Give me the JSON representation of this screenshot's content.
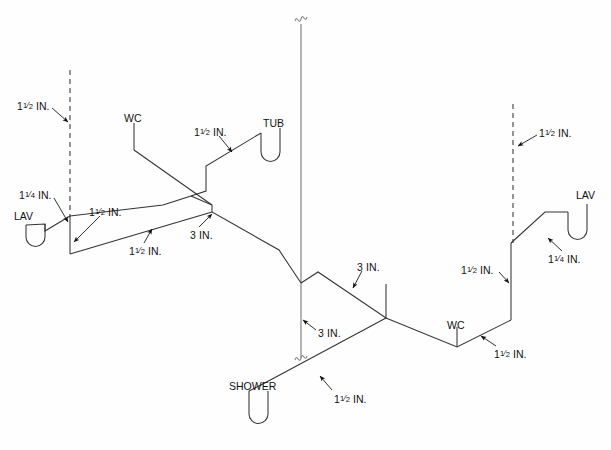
{
  "diagram": {
    "kind": "isometric-drainage-vent-riser",
    "background_color": "#ffffff",
    "pipe_color": "#333333",
    "stack_color": "#8c8c8c",
    "fixtures": [
      {
        "id": "lav-left",
        "label": "LAV",
        "x": 14,
        "y": 211
      },
      {
        "id": "wc-left",
        "label": "WC",
        "x": 124,
        "y": 113
      },
      {
        "id": "tub",
        "label": "TUB",
        "x": 263,
        "y": 118
      },
      {
        "id": "lav-right",
        "label": "LAV",
        "x": 576,
        "y": 190
      },
      {
        "id": "wc-right",
        "label": "WC",
        "x": 447,
        "y": 320
      },
      {
        "id": "shower",
        "label": "SHOWER",
        "x": 229,
        "y": 381
      }
    ],
    "size_callouts": [
      {
        "id": "vent-left-top",
        "whole": "1",
        "num": "1",
        "den": "2",
        "unit": "IN.",
        "x": 17,
        "y": 101
      },
      {
        "id": "lav-left-arm",
        "whole": "1",
        "num": "1",
        "den": "4",
        "unit": "IN.",
        "x": 19,
        "y": 190
      },
      {
        "id": "branch-left-up",
        "whole": "1",
        "num": "1",
        "den": "2",
        "unit": "IN.",
        "x": 89,
        "y": 207
      },
      {
        "id": "branch-left-low",
        "whole": "1",
        "num": "1",
        "den": "2",
        "unit": "IN.",
        "x": 129,
        "y": 246
      },
      {
        "id": "tub-arm",
        "whole": "1",
        "num": "1",
        "den": "2",
        "unit": "IN.",
        "x": 194,
        "y": 127
      },
      {
        "id": "branch-left-3in",
        "whole": "3",
        "num": "",
        "den": "",
        "unit": "IN.",
        "x": 190,
        "y": 230
      },
      {
        "id": "stack-3in",
        "whole": "3",
        "num": "",
        "den": "",
        "unit": "IN.",
        "x": 318,
        "y": 328
      },
      {
        "id": "branch-right-3in",
        "whole": "3",
        "num": "",
        "den": "",
        "unit": "IN.",
        "x": 357,
        "y": 262
      },
      {
        "id": "shower-arm",
        "whole": "1",
        "num": "1",
        "den": "2",
        "unit": "IN.",
        "x": 334,
        "y": 394
      },
      {
        "id": "wc-right-arm",
        "whole": "1",
        "num": "1",
        "den": "2",
        "unit": "IN.",
        "x": 494,
        "y": 349
      },
      {
        "id": "branch-right-up",
        "whole": "1",
        "num": "1",
        "den": "2",
        "unit": "IN.",
        "x": 461,
        "y": 265
      },
      {
        "id": "lav-right-arm",
        "whole": "1",
        "num": "1",
        "den": "4",
        "unit": "IN.",
        "x": 548,
        "y": 254
      },
      {
        "id": "vent-right-top",
        "whole": "1",
        "num": "1",
        "den": "2",
        "unit": "IN.",
        "x": 539,
        "y": 128
      }
    ]
  }
}
